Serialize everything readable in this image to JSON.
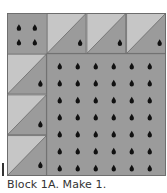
{
  "diagram": {
    "colors": {
      "light_fabric": "#c6c6c6",
      "dark_fabric": "#9b9b9b",
      "seam": "#6a6a6a",
      "dot": "#111111"
    },
    "layout": {
      "grid_units": 4,
      "top_row": [
        {
          "type": "dotted-square",
          "dots": 4
        },
        {
          "type": "half-square-triangle",
          "light": "upper-left",
          "dark": "lower-right",
          "dots": 1
        },
        {
          "type": "half-square-triangle",
          "light": "upper-left",
          "dark": "lower-right",
          "dots": 1
        },
        {
          "type": "half-square-triangle",
          "light": "upper-left",
          "dark": "lower-right",
          "dots": 1
        }
      ],
      "left_column": [
        {
          "type": "half-square-triangle",
          "light": "upper-left",
          "dark": "lower-right",
          "dots": 1
        },
        {
          "type": "half-square-triangle",
          "light": "upper-left",
          "dark": "lower-right",
          "dots": 1
        },
        {
          "type": "half-square-triangle",
          "light": "upper-left",
          "dark": "lower-right",
          "dots": 1
        }
      ],
      "center": {
        "type": "dotted-square",
        "size_units": 3,
        "dot_columns": 6,
        "dot_rows": 7
      }
    }
  },
  "caption": "Block 1A. Make 1."
}
